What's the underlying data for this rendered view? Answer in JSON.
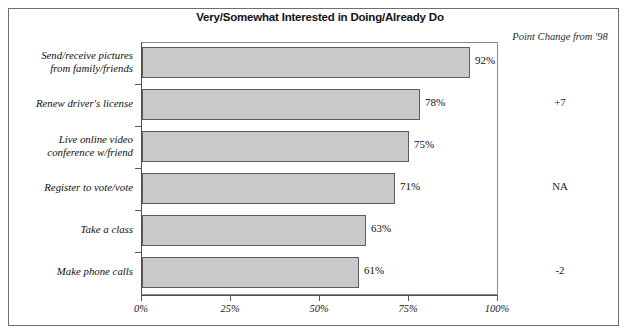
{
  "chart_data": {
    "type": "bar",
    "orientation": "horizontal",
    "title": "Very/Somewhat Interested in Doing/Already Do",
    "xlabel": "",
    "ylabel": "",
    "xlim": [
      0,
      100
    ],
    "xticks": [
      "0%",
      "25%",
      "50%",
      "75%",
      "100%"
    ],
    "xtick_values": [
      0,
      25,
      50,
      75,
      100
    ],
    "grid": false,
    "legend": null,
    "categories": [
      "Send/receive pictures from family/friends",
      "Renew driver's license",
      "Live online video conference w/friend",
      "Register to vote/vote",
      "Take a class",
      "Make phone calls"
    ],
    "values": [
      92,
      78,
      75,
      71,
      63,
      61
    ],
    "value_labels": [
      "92%",
      "78%",
      "75%",
      "71%",
      "63%",
      "61%"
    ],
    "bar_color": "#c9c9c9",
    "bar_edge_color": "#5c5c5c",
    "annotations": {
      "column_header": "Point Change from '98",
      "column_values": [
        "+7",
        "NA",
        "-2",
        "7*",
        "-6",
        "-4"
      ]
    }
  },
  "rows": [
    {
      "label_line1": "Send/receive pictures",
      "label_line2": "from family/friends",
      "value_label": "92%",
      "point_change": "+7"
    },
    {
      "label_line1": "Renew driver's license",
      "label_line2": "",
      "value_label": "78%",
      "point_change": "NA"
    },
    {
      "label_line1": "Live online video",
      "label_line2": "conference w/friend",
      "value_label": "75%",
      "point_change": "-2"
    },
    {
      "label_line1": "Register to vote/vote",
      "label_line2": "",
      "value_label": "71%",
      "point_change": "7*"
    },
    {
      "label_line1": "Take a class",
      "label_line2": "",
      "value_label": "63%",
      "point_change": "-6"
    },
    {
      "label_line1": "Make phone calls",
      "label_line2": "",
      "value_label": "61%",
      "point_change": "-4"
    }
  ],
  "axis": {
    "tick0": "0%",
    "tick1": "25%",
    "tick2": "50%",
    "tick3": "75%",
    "tick4": "100%"
  },
  "header": {
    "title": "Very/Somewhat Interested in Doing/Already Do",
    "point_change": "Point Change from '98"
  }
}
